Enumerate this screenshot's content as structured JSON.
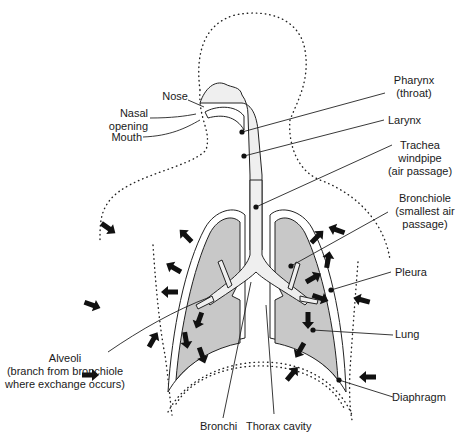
{
  "diagram": {
    "labels": {
      "nose": "Nose",
      "nasal_opening": [
        "Nasal",
        "opening"
      ],
      "mouth": "Mouth",
      "pharynx": [
        "Pharynx",
        "(throat)"
      ],
      "larynx": "Larynx",
      "trachea": [
        "Trachea",
        "windpipe",
        "(air passage)"
      ],
      "bronchiole": [
        "Bronchiole",
        "(smallest air",
        "passage)"
      ],
      "pleura": "Pleura",
      "lung": "Lung",
      "alveoli": [
        "Alveoli",
        "(branch from bronchiole",
        "where exchange occurs)"
      ],
      "bronchi": "Bronchi",
      "thorax_cavity": "Thorax cavity",
      "diaphragm": "Diaphragm"
    },
    "colors": {
      "lung_fill": "#c8c8c8",
      "ink": "#222222",
      "background": "#ffffff"
    }
  }
}
